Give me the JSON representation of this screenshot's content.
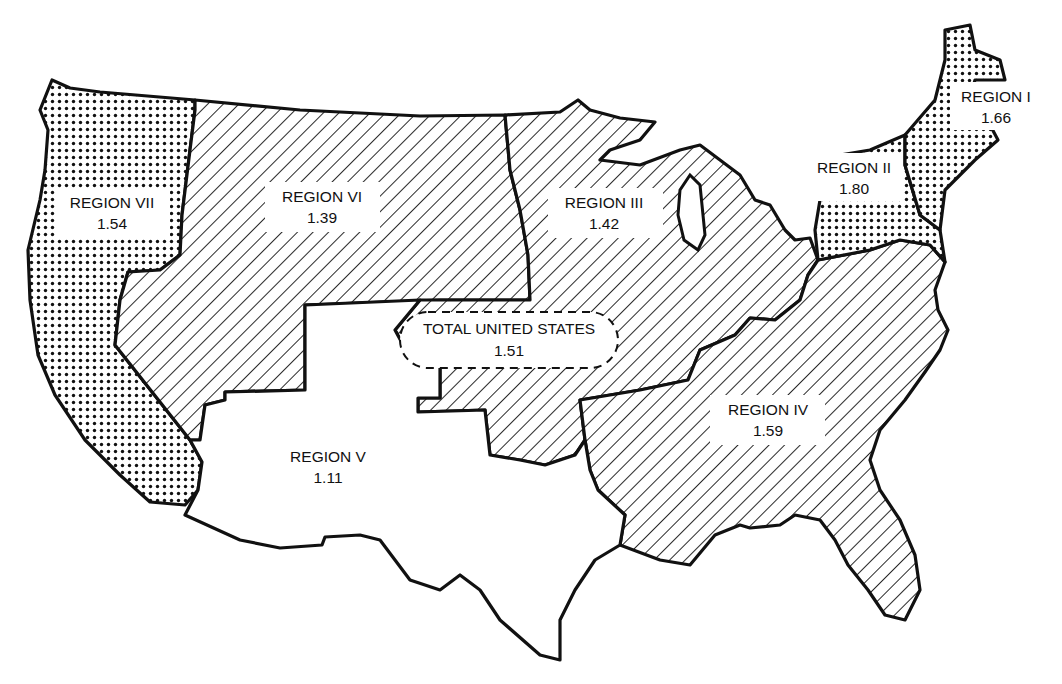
{
  "map": {
    "subject": "United States regions",
    "patterns": {
      "dotted": "stipple",
      "hatched": "diagonal-hatch",
      "blank": "none"
    },
    "regions": [
      {
        "id": "region-i",
        "name": "REGION I",
        "value": "1.66",
        "pattern": "dotted"
      },
      {
        "id": "region-ii",
        "name": "REGION II",
        "value": "1.80",
        "pattern": "dotted"
      },
      {
        "id": "region-iii",
        "name": "REGION III",
        "value": "1.42",
        "pattern": "hatched"
      },
      {
        "id": "region-iv",
        "name": "REGION IV",
        "value": "1.59",
        "pattern": "hatched"
      },
      {
        "id": "region-v",
        "name": "REGION V",
        "value": "1.11",
        "pattern": "blank"
      },
      {
        "id": "region-vi",
        "name": "REGION VI",
        "value": "1.39",
        "pattern": "hatched"
      },
      {
        "id": "region-vii",
        "name": "REGION VII",
        "value": "1.54",
        "pattern": "dotted"
      }
    ],
    "total": {
      "name": "TOTAL UNITED STATES",
      "value": "1.51"
    }
  }
}
